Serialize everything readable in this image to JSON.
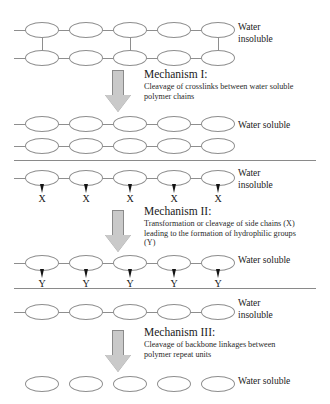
{
  "figure": {
    "bead_count_per_chain": 5,
    "colors": {
      "stroke": "#8e8e8e",
      "divider": "#8a8a8a",
      "arrow_fill": "#c9c9c9",
      "arrow_stroke": "#8a8a8a",
      "text": "#1a1a1a",
      "sidechain": "#141414",
      "background": "#ffffff"
    }
  },
  "labels": {
    "water_insoluble": "Water\ninsoluble",
    "water_soluble": "Water soluble"
  },
  "panels": [
    {
      "id": "mechanism-1",
      "state_before": "Water\ninsoluble",
      "state_after": "Water soluble",
      "mechanism_title": "Mechanism I:",
      "mechanism_body": "Cleavage of crosslinks between water soluble polymer chains",
      "before_structure": {
        "type": "crosslinked-network",
        "chains": 2,
        "beads_per_chain": 5,
        "crosslink_positions": [
          1,
          3,
          5
        ]
      },
      "after_structure": {
        "type": "linear-chain",
        "chains": 2,
        "beads_per_chain": 5,
        "crosslink_positions": []
      }
    },
    {
      "id": "mechanism-2",
      "state_before": "Water\ninsoluble",
      "state_after": "Water soluble",
      "mechanism_title": "Mechanism II:",
      "mechanism_body": "Transformation or cleavage of side chains (X) leading to the formation of hydrophilic groups (Y)",
      "before_structure": {
        "type": "linear-chain-with-side-chains",
        "chains": 1,
        "beads_per_chain": 5,
        "side_chain_label": "X",
        "side_chain_count": 5
      },
      "after_structure": {
        "type": "linear-chain-with-side-chains",
        "chains": 1,
        "beads_per_chain": 5,
        "side_chain_label": "Y",
        "side_chain_count": 5
      }
    },
    {
      "id": "mechanism-3",
      "state_before": "Water\ninsoluble",
      "state_after": "Water soluble",
      "mechanism_title": "Mechanism III:",
      "mechanism_body": "Cleavage of backbone linkages between polymer repeat units",
      "before_structure": {
        "type": "linear-chain",
        "chains": 1,
        "beads_per_chain": 5,
        "crosslink_positions": []
      },
      "after_structure": {
        "type": "fragmented-units",
        "chains": 1,
        "beads_per_chain": 5,
        "crosslink_positions": []
      }
    }
  ]
}
